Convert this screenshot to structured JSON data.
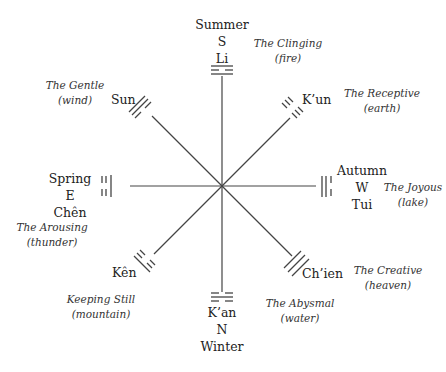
{
  "center": [
    222,
    186
  ],
  "stroke_color": "#444444",
  "trigrams": [
    {
      "id": "li",
      "name": "Li",
      "season": "Summer",
      "direction": "S",
      "meaning": "The Clinging",
      "element": "(fire)"
    },
    {
      "id": "kun",
      "name": "K’un",
      "meaning": "The Receptive",
      "element": "(earth)"
    },
    {
      "id": "tui",
      "name": "Tui",
      "season": "Autumn",
      "direction": "W",
      "meaning": "The Joyous",
      "element": "(lake)"
    },
    {
      "id": "chien",
      "name": "Ch’ien",
      "meaning": "The Creative",
      "element": "(heaven)"
    },
    {
      "id": "kan",
      "name": "K’an",
      "season": "Winter",
      "direction": "N",
      "meaning": "The Abysmal",
      "element": "(water)"
    },
    {
      "id": "ken",
      "name": "Kên",
      "meaning": "Keeping Still",
      "element": "(mountain)"
    },
    {
      "id": "chen",
      "name": "Chên",
      "season": "Spring",
      "direction": "E",
      "meaning": "The Arousing",
      "element": "(thunder)"
    },
    {
      "id": "sun",
      "name": "Sun",
      "meaning": "The Gentle",
      "element": "(wind)"
    }
  ]
}
